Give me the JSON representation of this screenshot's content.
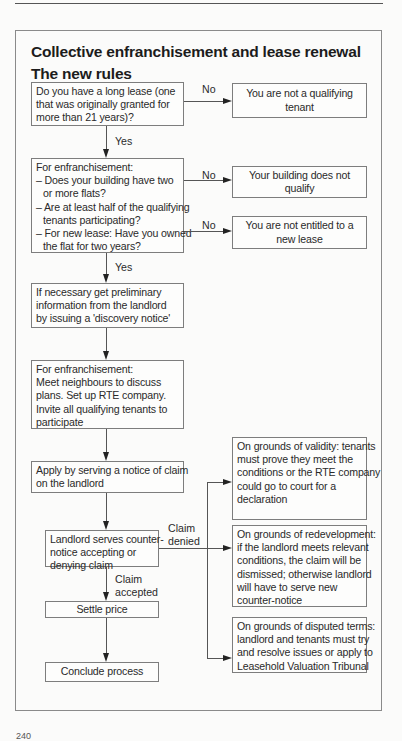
{
  "title": {
    "line1": "Collective enfranchisement and lease renewal",
    "line2": "The new rules"
  },
  "nodes": {
    "q_long_lease": [
      "Do you have a long lease (one",
      "that was originally granted for",
      "more than 21 years)?"
    ],
    "not_qualifying_tenant": [
      "You are not a qualifying",
      "tenant"
    ],
    "q_enfranchisement": {
      "heading": "For enfranchisement:",
      "items": [
        [
          "– Does your building have two",
          "or more flats?"
        ],
        [
          "– Are at least half of the qualifying",
          "tenants participating?"
        ],
        [
          "– For new lease: Have you owned",
          "the flat for two years?"
        ]
      ]
    },
    "building_not_qualify": [
      "Your building does not",
      "qualify"
    ],
    "not_entitled": [
      "You are not entitled to a",
      "new lease"
    ],
    "discovery_notice": [
      "If necessary get preliminary",
      "information from the landlord",
      "by issuing a 'discovery notice'"
    ],
    "meet_neighbours": [
      "For enfranchisement:",
      "Meet neighbours to discuss",
      "plans. Set up RTE company.",
      "Invite all qualifying tenants to",
      "participate"
    ],
    "notice_of_claim": [
      "Apply by serving a notice of claim",
      "on the landlord"
    ],
    "counter_notice": [
      "Landlord serves counter-",
      "notice accepting or",
      "denying claim"
    ],
    "settle_price": "Settle price",
    "conclude_process": "Conclude process",
    "grounds_validity": [
      "On grounds of validity: tenants",
      "must prove they meet the",
      "conditions or the RTE company",
      "could go to court for a",
      "declaration"
    ],
    "grounds_redevelopment": [
      "On grounds of redevelopment:",
      "if the landlord meets relevant",
      "conditions, the claim will be",
      "dismissed; otherwise landlord",
      "will have to serve new",
      "counter-notice"
    ],
    "grounds_disputed": [
      "On grounds of disputed terms:",
      "landlord and tenants must try",
      "and resolve issues or apply to",
      "Leasehold Valuation Tribunal"
    ]
  },
  "edge_labels": {
    "no1": "No",
    "yes1": "Yes",
    "no2": "No",
    "no3": "No",
    "yes2": "Yes",
    "claim_denied": [
      "Claim",
      "denied"
    ],
    "claim_accepted": [
      "Claim",
      "accepted"
    ]
  },
  "page_number": "240"
}
